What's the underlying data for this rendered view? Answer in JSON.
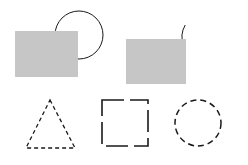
{
  "canvas": {
    "width": 248,
    "height": 165,
    "background_color": "#ffffff",
    "title": "Geometric shapes figure"
  },
  "palette": {
    "rectangle_fill": "#c6c6c6",
    "stroke_color": "#1a1a1a",
    "background": "#ffffff"
  },
  "shapes": [
    {
      "id": "rect-left",
      "name": "filled-rectangle-left",
      "type": "rectangle",
      "style": "filled",
      "fill": "#c6c6c6",
      "stroke": "none",
      "x": 15,
      "y": 31,
      "width": 63,
      "height": 46,
      "z": 2
    },
    {
      "id": "circle-solid-left",
      "name": "solid-circle-left",
      "type": "circle",
      "style": "solid-outline",
      "fill": "none",
      "stroke": "#1a1a1a",
      "stroke_width": 1,
      "cx": 79,
      "cy": 35,
      "r": 24,
      "z": 1
    },
    {
      "id": "rect-right",
      "name": "filled-rectangle-right",
      "type": "rectangle",
      "style": "filled",
      "fill": "#c6c6c6",
      "stroke": "none",
      "x": 126,
      "y": 39,
      "width": 60,
      "height": 45,
      "z": 2
    },
    {
      "id": "arc-right",
      "name": "broken-circle-arc-right",
      "type": "arc",
      "style": "solid-outline-open",
      "fill": "none",
      "stroke": "#1a1a1a",
      "stroke_width": 1,
      "cx": 206,
      "cy": 37,
      "r": 24,
      "start_angle_deg": 200,
      "end_angle_deg": 150,
      "gap_location": "left",
      "z": 1
    },
    {
      "id": "triangle-dashed",
      "name": "dashed-triangle",
      "type": "triangle",
      "style": "dashed-outline",
      "fill": "none",
      "stroke": "#1a1a1a",
      "stroke_width": 1.3,
      "dash_pattern": "4 3",
      "apex_x": 50,
      "apex_y": 100,
      "base_left_x": 26,
      "base_right_x": 75,
      "base_y": 148,
      "z": 1
    },
    {
      "id": "square-broken",
      "name": "broken-square-outline",
      "type": "square",
      "style": "long-dashed-outline",
      "fill": "none",
      "stroke": "#1a1a1a",
      "stroke_width": 1.6,
      "dash_pattern": "22 6",
      "x": 102,
      "y": 100,
      "width": 46,
      "height": 46,
      "z": 1
    },
    {
      "id": "circle-dashed",
      "name": "dashed-circle-right",
      "type": "circle",
      "style": "dashed-outline",
      "fill": "none",
      "stroke": "#1a1a1a",
      "stroke_width": 1.5,
      "dash_pattern": "6 4",
      "cx": 198,
      "cy": 123,
      "r": 23,
      "z": 1
    }
  ]
}
